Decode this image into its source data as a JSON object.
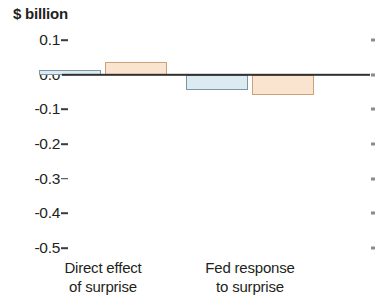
{
  "chart_data": {
    "type": "bar",
    "title": "",
    "subtitle": "",
    "ylabel": "$ billion",
    "xlabel": "",
    "categories": [
      "Direct effect of surprise",
      "Fed response to surprise"
    ],
    "category_lines": [
      [
        "Direct effect",
        "of surprise"
      ],
      [
        "Fed response",
        "to surprise"
      ]
    ],
    "series": [
      {
        "name": "series-blue",
        "color": "#dcebf1",
        "edge_color": "#7d97a6",
        "values": [
          0.013,
          -0.045
        ]
      },
      {
        "name": "series-peach",
        "color": "#fae4cf",
        "edge_color": "#c9a27a",
        "values": [
          0.037,
          -0.058
        ]
      }
    ],
    "ylim": [
      -0.55,
      0.13
    ],
    "yticks": [
      0.1,
      0.0,
      -0.1,
      -0.2,
      -0.3,
      -0.4,
      -0.5
    ],
    "ytick_labels": [
      "0.1",
      "0.0",
      "-0.1",
      "-0.2",
      "-0.3",
      "-0.4",
      "-0.5"
    ],
    "grid": false,
    "legend": "none",
    "zero_line": 0.0,
    "zero_line_color": "#32302e"
  },
  "axis": {
    "y_title": "$ billion",
    "tick_color": "#3d3a38",
    "right_tick_color": "#8e8a86"
  }
}
